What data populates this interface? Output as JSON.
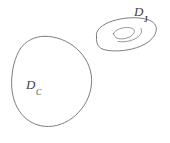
{
  "figure": {
    "background_color": "#ffffff",
    "stroke_color": "#6f6f6f",
    "label_color": "#3f3f3f",
    "width": 170,
    "height": 143
  },
  "labels": {
    "large_domain": {
      "base": "D",
      "subscript": "C",
      "full": "DC"
    },
    "torus_domain": {
      "base": "D",
      "subscript": "J",
      "full": "DJ"
    }
  },
  "shapes": [
    {
      "name": "large-blob",
      "label": "DC",
      "kind": "closed-blob",
      "description": "large irregular closed curve, lower-left of figure"
    },
    {
      "name": "torus-outer",
      "label": "DJ",
      "kind": "ellipse-outline",
      "description": "tilted outer ellipse, upper-right of figure"
    },
    {
      "name": "torus-inner",
      "label": "DJ",
      "kind": "ellipse-hole",
      "description": "small tilted inner ellipse forming the hole"
    },
    {
      "name": "torus-inner-arc",
      "label": "DJ",
      "kind": "arc",
      "description": "short shading arc beside the inner hole"
    }
  ]
}
